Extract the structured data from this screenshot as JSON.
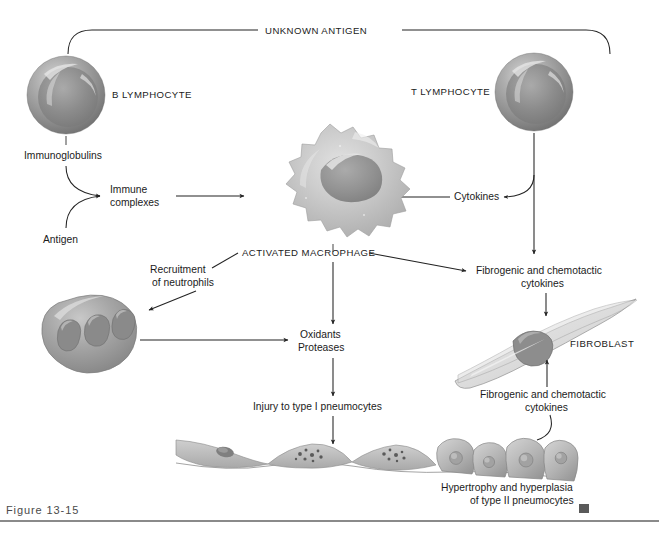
{
  "figure": {
    "caption": "Figure 13-15",
    "end_marker": "square-marker"
  },
  "labels": {
    "unknown_antigen": "UNKNOWN ANTIGEN",
    "b_lymphocyte": "B LYMPHOCYTE",
    "t_lymphocyte": "T LYMPHOCYTE",
    "immunoglobulins": "Immunoglobulins",
    "antigen": "Antigen",
    "immune_complexes_l1": "Immune",
    "immune_complexes_l2": "complexes",
    "cytokines": "Cytokines",
    "activated_macrophage": "ACTIVATED MACROPHAGE",
    "recruitment_l1": "Recruitment",
    "recruitment_l2": "of neutrophils",
    "oxidants": "Oxidants",
    "proteases": "Proteases",
    "injury_type_i": "Injury to type I pneumocytes",
    "fibrogenic_top_l1": "Fibrogenic and chemotactic",
    "fibrogenic_top_l2": "cytokines",
    "fibroblast": "FIBROBLAST",
    "fibrogenic_bottom_l1": "Fibrogenic and chemotactic",
    "fibrogenic_bottom_l2": "cytokines",
    "hypertrophy_l1": "Hypertrophy and hyperplasia",
    "hypertrophy_l2": "of type II pneumocytes"
  },
  "colors": {
    "line": "#232323",
    "text": "#1b1b1b",
    "caption": "#4a4a4a",
    "rule": "#8a8a8a",
    "cell_mid": "#9a9a9a",
    "cell_dark": "#6d6d6d",
    "cell_light": "#d8d8d8",
    "macrophage_fill": "#c9c9c9",
    "epithelium_fill": "#b9b9b9",
    "background": "#ffffff"
  },
  "flow": {
    "nodes": [
      "UNKNOWN ANTIGEN",
      "B LYMPHOCYTE",
      "T LYMPHOCYTE",
      "Immunoglobulins",
      "Antigen",
      "Immune complexes",
      "Cytokines",
      "ACTIVATED MACROPHAGE",
      "Recruitment of neutrophils",
      "Oxidants Proteases",
      "Injury to type I pneumocytes",
      "Fibrogenic and chemotactic cytokines",
      "FIBROBLAST",
      "Hypertrophy and hyperplasia of type II pneumocytes"
    ],
    "edges": [
      "UNKNOWN ANTIGEN -> B LYMPHOCYTE",
      "UNKNOWN ANTIGEN -> T LYMPHOCYTE",
      "Immunoglobulins -> Immune complexes",
      "Antigen -> Immune complexes",
      "Immune complexes -> ACTIVATED MACROPHAGE",
      "T LYMPHOCYTE -> Cytokines",
      "Cytokines -> ACTIVATED MACROPHAGE",
      "T LYMPHOCYTE -> Fibrogenic and chemotactic cytokines",
      "ACTIVATED MACROPHAGE -> Recruitment of neutrophils",
      "ACTIVATED MACROPHAGE -> Oxidants Proteases",
      "ACTIVATED MACROPHAGE -> Fibrogenic and chemotactic cytokines",
      "Neutrophil -> Oxidants Proteases",
      "Oxidants Proteases -> Injury to type I pneumocytes",
      "Injury to type I pneumocytes -> Alveolar epithelium",
      "Fibrogenic and chemotactic cytokines -> FIBROBLAST",
      "Hypertrophy and hyperplasia of type II pneumocytes -> FIBROBLAST"
    ]
  }
}
